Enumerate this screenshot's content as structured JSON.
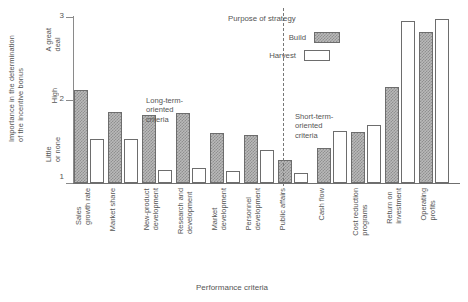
{
  "chart_data": {
    "type": "bar",
    "title": "",
    "xlabel": "Performance criteria",
    "ylabel": "Importance in the determination\nof the incentive bonus",
    "ylim": [
      1,
      3
    ],
    "yticks": [
      1,
      2,
      3
    ],
    "ytick_labels": [
      "1",
      "2",
      "3"
    ],
    "y_category_labels": [
      {
        "value": 3,
        "label": "A great\ndeal"
      },
      {
        "value": 2,
        "label": "High"
      },
      {
        "value": 1,
        "label": "Little\nor none"
      }
    ],
    "grid": false,
    "legend": {
      "title": "Purpose of strategy",
      "position": "top-right",
      "entries": [
        {
          "name": "Build",
          "pattern": "checkered-gray"
        },
        {
          "name": "Harvest",
          "pattern": "white-outline"
        }
      ]
    },
    "categories": [
      "Sales\ngrowth rate",
      "Market share",
      "New-product\ndevelopment",
      "Research and\ndevelopment",
      "Market\ndevelopment",
      "Personnel\ndevelopment",
      "Public affairs",
      "Cash flow",
      "Cost reduction\nprograms",
      "Return on\ninvestment",
      "Operating\nprofits"
    ],
    "series": [
      {
        "name": "Build",
        "values": [
          2.12,
          1.85,
          1.82,
          1.84,
          1.6,
          1.58,
          1.28,
          1.42,
          1.62,
          2.16,
          2.82
        ]
      },
      {
        "name": "Harvest",
        "values": [
          1.53,
          1.53,
          1.16,
          1.18,
          1.15,
          1.4,
          1.12,
          1.63,
          1.7,
          2.95,
          2.98
        ]
      }
    ],
    "annotations": [
      {
        "text": "Long-term-\noriented\ncriteria",
        "group": "left"
      },
      {
        "text": "Short-term-\noriented\ncriteria",
        "group": "right"
      }
    ],
    "divider": {
      "after_category_index": 6,
      "style": "dashed"
    },
    "colors": {
      "build_fill": "#b9b9b9",
      "build_hatch": "#8f8f8f",
      "harvest_fill": "#ffffff",
      "bar_border": "#6d6d6d",
      "axis": "#6f6f6f",
      "text": "#555555"
    }
  }
}
